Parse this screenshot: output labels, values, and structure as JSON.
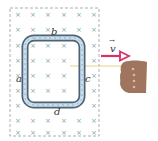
{
  "diagram": {
    "type": "electromagnetic-induction",
    "field_symbol": "×",
    "field_region": {
      "x": 10,
      "y": 8,
      "width": 89,
      "height": 128,
      "border_color": "#9a9a9a"
    },
    "field_marks": {
      "xs": [
        18,
        33,
        48,
        64,
        79,
        94
      ],
      "ys": [
        14,
        29,
        45,
        60,
        75,
        90,
        105,
        120,
        132
      ],
      "color": "#7aa8a0"
    },
    "loop": {
      "x": 25,
      "y": 38,
      "width": 57,
      "height": 67,
      "outer_color": "#5a6e80",
      "inner_color": "#c9dff0"
    },
    "labels": {
      "side_top": "b",
      "side_left": "a",
      "side_right": "c",
      "side_bottom": "d",
      "velocity": "v",
      "velocity_arrow_mark": "→"
    },
    "velocity_arrow": {
      "x1": 101,
      "x2": 128,
      "y": 56,
      "color": "#d6336c"
    },
    "pull_line": {
      "x1": 70,
      "x2": 121,
      "y": 66,
      "color": "#e8cf8a"
    },
    "hand": {
      "color": "#a07560",
      "knuckle_color": "#d8b8a0"
    }
  }
}
